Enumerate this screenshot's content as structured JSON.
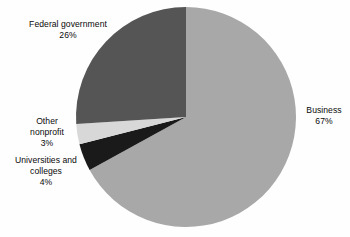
{
  "chart_data": {
    "type": "pie",
    "title": "",
    "subtitle": "",
    "xlabel": "",
    "ylabel": "",
    "grid": false,
    "legend_position": "none",
    "label_style": "outside-callout",
    "start_angle_deg": 0,
    "direction": "clockwise",
    "categories": [
      "Business",
      "Universities and colleges",
      "Other nonprofit",
      "Federal government"
    ],
    "values": [
      67,
      4,
      3,
      26
    ],
    "value_suffix": "%",
    "colors": [
      "#a8a8a8",
      "#1a1a1a",
      "#d8d8d8",
      "#555555"
    ],
    "slices": [
      {
        "name": "Business",
        "value": 67,
        "value_text": "67%",
        "color": "#a8a8a8",
        "start_deg": 0,
        "end_deg": 241.2
      },
      {
        "name": "Universities and colleges",
        "value": 4,
        "value_text": "4%",
        "color": "#1a1a1a",
        "start_deg": 241.2,
        "end_deg": 255.6
      },
      {
        "name": "Other nonprofit",
        "value": 3,
        "value_text": "3%",
        "color": "#d8d8d8",
        "start_deg": 255.6,
        "end_deg": 266.4
      },
      {
        "name": "Federal government",
        "value": 26,
        "value_text": "26%",
        "color": "#555555",
        "start_deg": 266.4,
        "end_deg": 360
      }
    ]
  },
  "geometry": {
    "center_x": 186,
    "center_y": 117,
    "radius": 110
  },
  "labels": {
    "federal": {
      "line1": "Federal government",
      "line2": "26%"
    },
    "business": {
      "line1": "Business",
      "line2": "67%"
    },
    "nonprofit": {
      "line1": "Other",
      "line2": "nonprofit",
      "line3": "3%"
    },
    "universities": {
      "line1": "Universities and",
      "line2": "colleges",
      "line3": "4%"
    }
  },
  "style": {
    "background": "#fefefe",
    "text_color": "#0a0a0a"
  }
}
